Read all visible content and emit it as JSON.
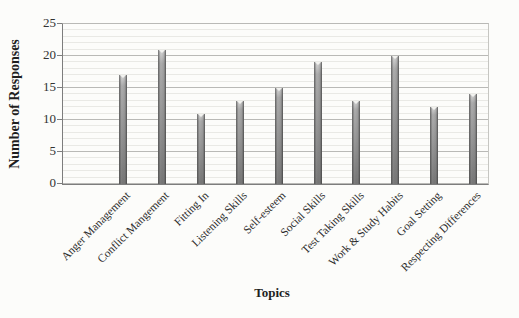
{
  "figure": {
    "background_color": "#fcfcfa",
    "text_color": "#2f2f2f",
    "bar_color": "#979797",
    "major_grid_color": "#b9b9b6",
    "minor_grid_color": "#e9e9e5",
    "axis_color": "#7d7d7d"
  },
  "chart_data": {
    "type": "bar",
    "title": "",
    "xlabel": "Topics",
    "ylabel": "Number of Responses",
    "categories": [
      "Anger Management",
      "Conflict Mangement",
      "Fitting In",
      "Listening Skills",
      "Self-esteem",
      "Social Skills",
      "Test Taking Skills",
      "Work & Study Habits",
      "Goal Setting",
      "Respecting Differences"
    ],
    "values": [
      17,
      21,
      11,
      13,
      15,
      19,
      13,
      20,
      12,
      14
    ],
    "ylim": [
      0,
      25
    ],
    "ytick_step": 5,
    "minor_grid_step": 1,
    "grid": "horizontal",
    "legend": "none",
    "category_label_rotation_deg": -45
  }
}
